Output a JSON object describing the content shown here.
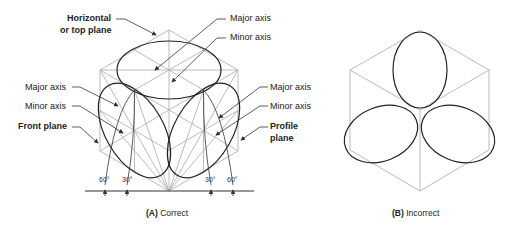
{
  "figure_a": {
    "caption_letter": "(A)",
    "caption_text": "Correct",
    "labels": {
      "horizontal_plane_1": "Horizontal",
      "horizontal_plane_2": "or top plane",
      "top_major_axis": "Major axis",
      "top_minor_axis": "Minor axis",
      "left_major_axis": "Major axis",
      "left_minor_axis": "Minor axis",
      "front_plane": "Front plane",
      "right_major_axis": "Major axis",
      "right_minor_axis": "Minor axis",
      "profile_plane_1": "Profile",
      "profile_plane_2": "plane"
    },
    "angles": [
      "60°",
      "30°",
      "30°",
      "60°"
    ]
  },
  "figure_b": {
    "caption_letter": "(B)",
    "caption_text": "Incorrect"
  },
  "colors": {
    "construction_line": "#aaaaaa",
    "ellipse": "#222222",
    "leader": "#333333"
  }
}
